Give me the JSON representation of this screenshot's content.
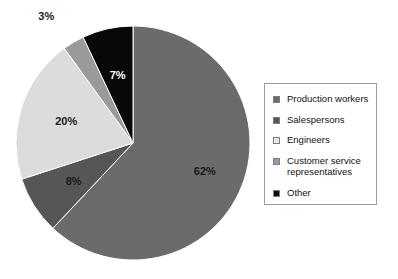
{
  "chart_data": {
    "type": "pie",
    "title": "",
    "categories": [
      "Production workers",
      "Salespersons",
      "Engineers",
      "Customer service representatives",
      "Other"
    ],
    "values": [
      62,
      8,
      20,
      3,
      7
    ],
    "value_labels": [
      "62%",
      "8%",
      "20%",
      "3%",
      "7%"
    ],
    "colors": [
      "#6b6b6b",
      "#565656",
      "#dcdcdc",
      "#9a9a9a",
      "#080808"
    ],
    "label_text_colors": [
      "#1a1a1a",
      "#1a1a1a",
      "#1a1a1a",
      "#1a1a1a",
      "#ffffff"
    ],
    "start_angle_deg": 0,
    "direction": "clockwise",
    "legend_position": "right",
    "grid": false,
    "xlabel": "",
    "ylabel": ""
  },
  "legend": {
    "items": [
      {
        "label": "Production workers",
        "color": "#6b6b6b"
      },
      {
        "label": "Salespersons",
        "color": "#565656"
      },
      {
        "label": "Engineers",
        "color": "#e6e6e6"
      },
      {
        "label": "Customer service\nrepresentatives",
        "color": "#9a9a9a"
      },
      {
        "label": "Other",
        "color": "#0d0d0d"
      }
    ]
  },
  "slice_labels": {
    "production_workers": "62%",
    "salespersons": "8%",
    "engineers": "20%",
    "customer_service": "3%",
    "other": "7%"
  }
}
